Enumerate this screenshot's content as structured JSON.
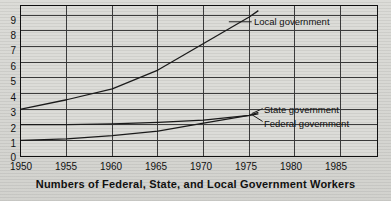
{
  "chart_data": {
    "type": "line",
    "title": "Numbers of Federal, State, and Local Government Workers",
    "xlabel": "",
    "ylabel": "",
    "xlim": [
      1950,
      1989
    ],
    "ylim": [
      0,
      9.6
    ],
    "grid": true,
    "legend_position": "inline-right",
    "x_ticks": [
      "1950",
      "1955",
      "1960",
      "1965",
      "1970",
      "1975",
      "1980",
      "1985"
    ],
    "x_tick_values": [
      1950,
      1955,
      1960,
      1965,
      1970,
      1975,
      1980,
      1985
    ],
    "y_ticks": [
      "0",
      "1",
      "2",
      "3",
      "4",
      "5",
      "6",
      "7",
      "8",
      "9"
    ],
    "y_tick_values": [
      0,
      1,
      2,
      3,
      4,
      5,
      6,
      7,
      8,
      9
    ],
    "x": [
      1950,
      1955,
      1960,
      1965,
      1970,
      1975,
      1976
    ],
    "series": [
      {
        "name": "Local government",
        "label": "Local government",
        "color": "#1b1b1b",
        "values": [
          3.0,
          3.6,
          4.3,
          5.5,
          7.2,
          8.9,
          9.3
        ]
      },
      {
        "name": "State government",
        "label": "State government",
        "color": "#1b1b1b",
        "values": [
          1.0,
          1.1,
          1.3,
          1.6,
          2.1,
          2.6,
          2.8
        ]
      },
      {
        "name": "Federal government",
        "label": "Federal government",
        "color": "#1b1b1b",
        "values": [
          2.0,
          2.0,
          2.05,
          2.15,
          2.3,
          2.6,
          2.7
        ]
      }
    ],
    "annotations": [
      {
        "text": "Local government",
        "x": 1976,
        "y": 9.1
      },
      {
        "text": "State government",
        "x": 1976,
        "y": 3.0
      },
      {
        "text": "Federal government",
        "x": 1976,
        "y": 2.25
      }
    ]
  },
  "caption": {
    "text": "Numbers of Federal, State, and Local Government Workers"
  },
  "axes": {
    "y_labels": [
      "9",
      "8",
      "7",
      "6",
      "5",
      "4",
      "3",
      "2",
      "1",
      "0"
    ],
    "x_labels": [
      "1950",
      "1955",
      "1960",
      "1965",
      "1970",
      "1975",
      "1980",
      "1985"
    ]
  },
  "colors": {
    "paper": "#d6d6d2",
    "ink": "#111111",
    "grid": "#3a3a3a"
  }
}
